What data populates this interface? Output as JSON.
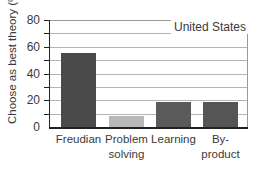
{
  "chart_data": {
    "type": "bar",
    "title": "",
    "legend_label": "United States",
    "xlabel": "",
    "ylabel": "Choose as best theory (%)",
    "ylim": [
      0,
      80
    ],
    "yticks": [
      0,
      20,
      40,
      60,
      80
    ],
    "minor_gridlines_every": 10,
    "categories": [
      "Freudian",
      "Problem solving",
      "Learning",
      "By-product"
    ],
    "category_lines": [
      [
        "Freudian"
      ],
      [
        "Problem",
        "solving"
      ],
      [
        "Learning"
      ],
      [
        "By-",
        "product"
      ]
    ],
    "values": [
      55,
      8,
      19,
      19
    ],
    "bar_colors": [
      "#4a4a4a",
      "#b8b8b8",
      "#5a5a5a",
      "#555555"
    ],
    "grid": true,
    "legend_position": "top-right"
  }
}
